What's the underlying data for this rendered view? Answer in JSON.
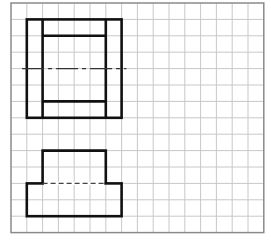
{
  "grid": {
    "origin_x": 11,
    "origin_y": 3,
    "cols": 16,
    "rows": 14,
    "cell_w": 15.8,
    "cell_h": 16.4,
    "line_color": "#c8c8c8",
    "border_color": "#8a8a8a"
  },
  "colors": {
    "stroke": "#111111",
    "background": "#ffffff"
  },
  "figures": {
    "top_view": {
      "outer_rect": {
        "c1": 1,
        "r1": 1,
        "c2": 7,
        "r2": 7
      },
      "inner_verticals": [
        2,
        6
      ],
      "inner_horizontals": [
        2,
        6
      ],
      "inner_span": {
        "c1": 2,
        "c2": 6
      },
      "centerline": {
        "row": 4,
        "c1": 0.7,
        "c2": 7.3,
        "style": "dash-dot"
      }
    },
    "front_view": {
      "upper_rect": {
        "c1": 2,
        "r1": 9,
        "c2": 6,
        "r2": 11
      },
      "lower_rect": {
        "c1": 1,
        "r1": 11,
        "c2": 7,
        "r2": 13
      },
      "hidden_line": {
        "row": 11,
        "c1": 2,
        "c2": 6,
        "style": "dashed"
      }
    }
  }
}
